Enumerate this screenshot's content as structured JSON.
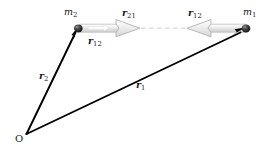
{
  "figure": {
    "background_color": "#ffffff"
  },
  "points": {
    "origin": {
      "label": "O",
      "x": 26,
      "y": 134
    },
    "mass1": {
      "label_base": "m",
      "label_sub": "1",
      "x": 246,
      "y": 29
    },
    "mass2": {
      "label_base": "m",
      "label_sub": "2",
      "x": 78,
      "y": 29
    }
  },
  "vectors": {
    "r1": {
      "label_base": "r",
      "label_sub": "1",
      "from": "origin",
      "to": "mass1",
      "color": "#000000",
      "style": "solid-bold-arrow"
    },
    "r2": {
      "label_base": "r",
      "label_sub": "2",
      "from": "origin",
      "to": "mass2",
      "color": "#000000",
      "style": "solid-bold-arrow"
    },
    "r21": {
      "label_base": "r",
      "label_sub": "21",
      "from": "mass2",
      "direction": "right",
      "color": "#b8b8b8",
      "style": "hollow-block-arrow"
    },
    "r12_right": {
      "label_base": "r",
      "label_sub": "12",
      "from": "mass1",
      "direction": "left",
      "color": "#b8b8b8",
      "style": "hollow-block-arrow"
    },
    "r12_lower": {
      "label_base": "r",
      "label_sub": "12",
      "color": "#1a1a1a",
      "style": "text-only-label"
    }
  },
  "connector": {
    "name": "dashed-separation-line",
    "color": "#c9c9c9",
    "style": "dashed",
    "x1": 140,
    "x2": 186,
    "y": 28
  },
  "colors": {
    "vector_black": "#000000",
    "arrow_gray_fill": "#ededed",
    "arrow_gray_stroke": "#b0b0b0",
    "dash_gray": "#c9c9c9",
    "label_ink": "#1a1a1a"
  }
}
